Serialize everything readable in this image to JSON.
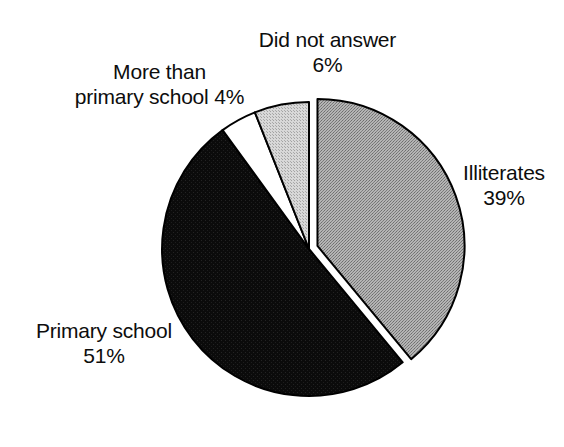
{
  "chart_data": {
    "type": "pie",
    "title": "",
    "subtitle": "",
    "xlabel": "",
    "ylabel": "",
    "legend_position": "none",
    "grid": false,
    "start_angle_deg": 0,
    "direction": "clockwise",
    "categories": [
      "Illiterates",
      "Primary school",
      "More than primary school",
      "Did not answer"
    ],
    "values": [
      39,
      51,
      4,
      6
    ],
    "unit": "%",
    "total": 100,
    "slices": [
      {
        "label": "Illiterates",
        "value": 39,
        "value_text": "39%",
        "fill": "#a0a0a0",
        "pattern": "dither-medium-gray",
        "stroke": "#000000",
        "exploded": true,
        "start_deg": 0,
        "end_deg": 140.4
      },
      {
        "label": "Primary school",
        "value": 51,
        "value_text": "51%",
        "fill": "#111111",
        "pattern": "solid-black",
        "stroke": "#000000",
        "exploded": false,
        "start_deg": 140.4,
        "end_deg": 324.0
      },
      {
        "label": "More than primary school",
        "value": 4,
        "value_text": "4%",
        "fill": "#ffffff",
        "pattern": "solid-white",
        "stroke": "#000000",
        "exploded": false,
        "start_deg": 324.0,
        "end_deg": 338.4
      },
      {
        "label": "Did not answer",
        "value": 6,
        "value_text": "6%",
        "fill": "#c8c8c8",
        "pattern": "dither-light-gray",
        "stroke": "#000000",
        "exploded": false,
        "start_deg": 338.4,
        "end_deg": 360.0
      }
    ]
  },
  "labels": {
    "did_not_answer": {
      "line1": "Did not answer",
      "line2": "6%"
    },
    "more_than_primary": {
      "line1": "More than",
      "line2": "primary school 4%"
    },
    "illiterates": {
      "line1": "Illiterates",
      "line2": "39%"
    },
    "primary_school": {
      "line1": "Primary school",
      "line2": "51%"
    }
  },
  "colors": {
    "text": "#0d0d0d",
    "background": "#ffffff",
    "outline": "#000000",
    "slice_illiterates": "#a0a0a0",
    "slice_primary_school": "#111111",
    "slice_more_than_primary": "#ffffff",
    "slice_did_not_answer": "#c8c8c8"
  }
}
